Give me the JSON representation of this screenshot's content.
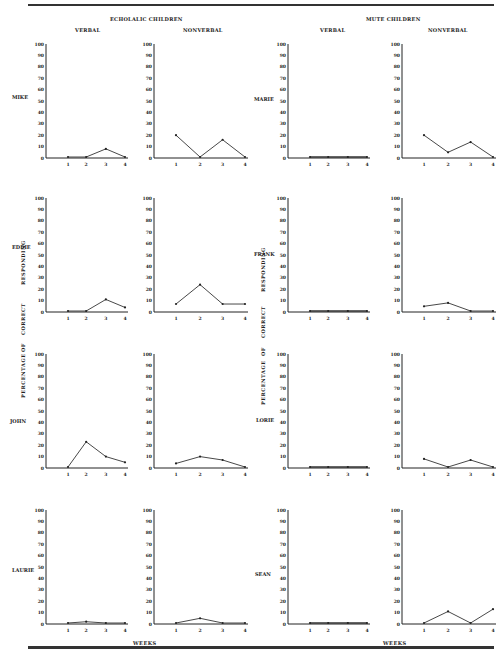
{
  "headers": {
    "echolalic": "ECHOLALIC CHILDREN",
    "mute": "MUTE CHILDREN",
    "verbal": "VERBAL",
    "nonverbal": "NONVERBAL"
  },
  "y_axis_label_words": [
    "PERCENTAGE",
    "OF",
    "CORRECT",
    "RESPONDING"
  ],
  "x_axis_label": "WEEKS",
  "y_ticks": [
    0,
    10,
    20,
    30,
    40,
    50,
    60,
    70,
    80,
    90,
    100
  ],
  "x_ticks": [
    "1",
    "2",
    "3",
    "4"
  ],
  "children": [
    {
      "name": "MIKE",
      "group": "echolalic"
    },
    {
      "name": "EDDIE",
      "group": "echolalic"
    },
    {
      "name": "JOHN",
      "group": "echolalic"
    },
    {
      "name": "LAURIE",
      "group": "echolalic"
    },
    {
      "name": "MARIE",
      "group": "mute"
    },
    {
      "name": "FRANK",
      "group": "mute"
    },
    {
      "name": "LORIE",
      "group": "mute"
    },
    {
      "name": "SEAN",
      "group": "mute"
    }
  ],
  "chart_data": [
    {
      "type": "line",
      "title": "MIKE - VERBAL",
      "group": "Echolalic Children",
      "x": [
        1,
        2,
        3,
        4
      ],
      "values": [
        0,
        0,
        8,
        0
      ],
      "xlabel": "WEEKS",
      "ylabel": "PERCENTAGE OF CORRECT RESPONDING",
      "ylim": [
        0,
        100
      ],
      "grid": false
    },
    {
      "type": "line",
      "title": "MIKE - NONVERBAL",
      "group": "Echolalic Children",
      "x": [
        1,
        2,
        3,
        4
      ],
      "values": [
        20,
        0,
        16,
        0
      ],
      "xlabel": "WEEKS",
      "ylabel": "PERCENTAGE OF CORRECT RESPONDING",
      "ylim": [
        0,
        100
      ],
      "grid": false
    },
    {
      "type": "line",
      "title": "EDDIE - VERBAL",
      "group": "Echolalic Children",
      "x": [
        1,
        2,
        3,
        4
      ],
      "values": [
        0,
        0,
        11,
        4
      ],
      "xlabel": "WEEKS",
      "ylabel": "PERCENTAGE OF CORRECT RESPONDING",
      "ylim": [
        0,
        100
      ],
      "grid": false
    },
    {
      "type": "line",
      "title": "EDDIE - NONVERBAL",
      "group": "Echolalic Children",
      "x": [
        1,
        2,
        3,
        4
      ],
      "values": [
        7,
        24,
        7,
        7
      ],
      "xlabel": "WEEKS",
      "ylabel": "PERCENTAGE OF CORRECT RESPONDING",
      "ylim": [
        0,
        100
      ],
      "grid": false
    },
    {
      "type": "line",
      "title": "JOHN - VERBAL",
      "group": "Echolalic Children",
      "x": [
        1,
        2,
        3,
        4
      ],
      "values": [
        0,
        23,
        10,
        5
      ],
      "xlabel": "WEEKS",
      "ylabel": "PERCENTAGE OF CORRECT RESPONDING",
      "ylim": [
        0,
        100
      ],
      "grid": false
    },
    {
      "type": "line",
      "title": "JOHN - NONVERBAL",
      "group": "Echolalic Children",
      "x": [
        1,
        2,
        3,
        4
      ],
      "values": [
        4,
        10,
        7,
        0
      ],
      "xlabel": "WEEKS",
      "ylabel": "PERCENTAGE OF CORRECT RESPONDING",
      "ylim": [
        0,
        100
      ],
      "grid": false
    },
    {
      "type": "line",
      "title": "LAURIE - VERBAL",
      "group": "Echolalic Children",
      "x": [
        1,
        2,
        3,
        4
      ],
      "values": [
        0,
        2,
        0,
        0
      ],
      "xlabel": "WEEKS",
      "ylabel": "PERCENTAGE OF CORRECT RESPONDING",
      "ylim": [
        0,
        100
      ],
      "grid": false
    },
    {
      "type": "line",
      "title": "LAURIE - NONVERBAL",
      "group": "Echolalic Children",
      "x": [
        1,
        2,
        3,
        4
      ],
      "values": [
        0,
        5,
        0,
        0
      ],
      "xlabel": "WEEKS",
      "ylabel": "PERCENTAGE OF CORRECT RESPONDING",
      "ylim": [
        0,
        100
      ],
      "grid": false
    },
    {
      "type": "line",
      "title": "MARIE - VERBAL",
      "group": "Mute Children",
      "x": [
        1,
        2,
        3,
        4
      ],
      "values": [
        0,
        0,
        0,
        0
      ],
      "xlabel": "WEEKS",
      "ylabel": "PERCENTAGE OF CORRECT RESPONDING",
      "ylim": [
        0,
        100
      ],
      "grid": false
    },
    {
      "type": "line",
      "title": "MARIE - NONVERBAL",
      "group": "Mute Children",
      "x": [
        1,
        2,
        3,
        4
      ],
      "values": [
        20,
        5,
        14,
        0
      ],
      "xlabel": "WEEKS",
      "ylabel": "PERCENTAGE OF CORRECT RESPONDING",
      "ylim": [
        0,
        100
      ],
      "grid": false
    },
    {
      "type": "line",
      "title": "FRANK - VERBAL",
      "group": "Mute Children",
      "x": [
        1,
        2,
        3,
        4
      ],
      "values": [
        0,
        0,
        0,
        0
      ],
      "xlabel": "WEEKS",
      "ylabel": "PERCENTAGE OF CORRECT RESPONDING",
      "ylim": [
        0,
        100
      ],
      "grid": false
    },
    {
      "type": "line",
      "title": "FRANK - NONVERBAL",
      "group": "Mute Children",
      "x": [
        1,
        2,
        3,
        4
      ],
      "values": [
        5,
        8,
        0,
        0
      ],
      "xlabel": "WEEKS",
      "ylabel": "PERCENTAGE OF CORRECT RESPONDING",
      "ylim": [
        0,
        100
      ],
      "grid": false
    },
    {
      "type": "line",
      "title": "LORIE - VERBAL",
      "group": "Mute Children",
      "x": [
        1,
        2,
        3,
        4
      ],
      "values": [
        0,
        0,
        0,
        0
      ],
      "xlabel": "WEEKS",
      "ylabel": "PERCENTAGE OF CORRECT RESPONDING",
      "ylim": [
        0,
        100
      ],
      "grid": false
    },
    {
      "type": "line",
      "title": "LORIE - NONVERBAL",
      "group": "Mute Children",
      "x": [
        1,
        2,
        3,
        4
      ],
      "values": [
        8,
        0,
        7,
        0
      ],
      "xlabel": "WEEKS",
      "ylabel": "PERCENTAGE OF CORRECT RESPONDING",
      "ylim": [
        0,
        100
      ],
      "grid": false
    },
    {
      "type": "line",
      "title": "SEAN - VERBAL",
      "group": "Mute Children",
      "x": [
        1,
        2,
        3,
        4
      ],
      "values": [
        0,
        0,
        0,
        0
      ],
      "xlabel": "WEEKS",
      "ylabel": "PERCENTAGE OF CORRECT RESPONDING",
      "ylim": [
        0,
        100
      ],
      "grid": false
    },
    {
      "type": "line",
      "title": "SEAN - NONVERBAL",
      "group": "Mute Children",
      "x": [
        1,
        2,
        3,
        4
      ],
      "values": [
        0,
        11,
        0,
        13
      ],
      "xlabel": "WEEKS",
      "ylabel": "PERCENTAGE OF CORRECT RESPONDING",
      "ylim": [
        0,
        100
      ],
      "grid": false
    }
  ]
}
